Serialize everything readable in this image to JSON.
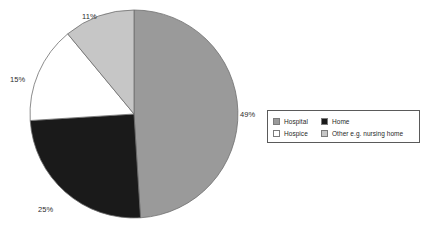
{
  "chart_data": {
    "type": "pie",
    "title": "",
    "categories": [
      "Hospital",
      "Home",
      "Hospice",
      "Other e.g. nursing home"
    ],
    "values": [
      49,
      25,
      15,
      11
    ],
    "value_unit": "%",
    "data_labels": [
      "49%",
      "25%",
      "15%",
      "11%"
    ],
    "colors": [
      "#9a9a9a",
      "#1a1a1a",
      "#ffffff",
      "#c6c6c6"
    ],
    "slice_order": "clockwise from 12 o'clock",
    "legend_position": "right",
    "legend_entries": [
      {
        "label": "Hospital",
        "color": "#9a9a9a"
      },
      {
        "label": "Home",
        "color": "#1a1a1a"
      },
      {
        "label": "Hospice",
        "color": "#ffffff"
      },
      {
        "label": "Other e.g. nursing home",
        "color": "#c6c6c6"
      }
    ],
    "grid": false,
    "xlabel": "",
    "ylabel": ""
  },
  "labels": {
    "hospital_pct": "49%",
    "home_pct": "25%",
    "hospice_pct": "15%",
    "other_pct": "11%"
  },
  "legend": {
    "hospital": "Hospital",
    "home": "Home",
    "hospice": "Hospice",
    "other": "Other e.g. nursing home"
  },
  "colors": {
    "hospital": "#9a9a9a",
    "home": "#1a1a1a",
    "hospice": "#ffffff",
    "other": "#c6c6c6",
    "slice_outline": "#6e6e6e",
    "legend_border": "#5a5a5a",
    "swatch_border": "#7b7b7b",
    "background": "#ffffff"
  }
}
